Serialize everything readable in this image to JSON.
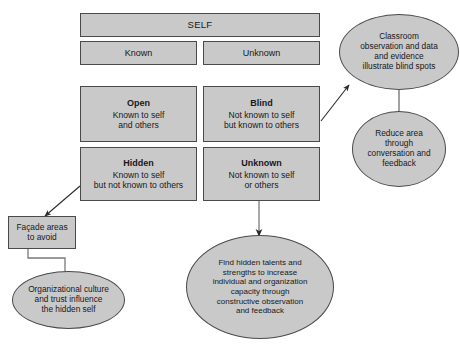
{
  "diagram": {
    "colors": {
      "node_fill": "#c9c9c9",
      "node_stroke": "#4a4a4a",
      "text": "#18181a",
      "background": "#ffffff"
    }
  },
  "header": {
    "self_label": "SELF",
    "known_label": "Known",
    "unknown_label": "Unknown"
  },
  "quadrants": [
    {
      "id": "open",
      "title": "Open",
      "lines": [
        "Known to self",
        "and others"
      ]
    },
    {
      "id": "blind",
      "title": "Blind",
      "lines": [
        "Not known to self",
        "but known to others"
      ]
    },
    {
      "id": "hidden",
      "title": "Hidden",
      "lines": [
        "Known to self",
        "but not known to others"
      ]
    },
    {
      "id": "unknown",
      "title": "Unknown",
      "lines": [
        "Not known to self",
        "or others"
      ]
    }
  ],
  "facade_box": {
    "lines": [
      "Façade areas",
      "to avoid"
    ]
  },
  "callouts": [
    {
      "id": "classroom",
      "lines": [
        "Classroom",
        "observation and data",
        "and evidence",
        "illustrate blind spots"
      ]
    },
    {
      "id": "reduce-area",
      "lines": [
        "Reduce area",
        "through",
        "conversation and",
        "feedback"
      ]
    },
    {
      "id": "organizational-culture",
      "lines": [
        "Organizational culture",
        "and  trust influence",
        "the hidden self"
      ]
    },
    {
      "id": "find-hidden-talents",
      "lines": [
        "Find hidden talents and",
        "strengths to increase",
        "individual and organization",
        "capacity through",
        "constructive observation",
        "and feedback"
      ]
    }
  ]
}
